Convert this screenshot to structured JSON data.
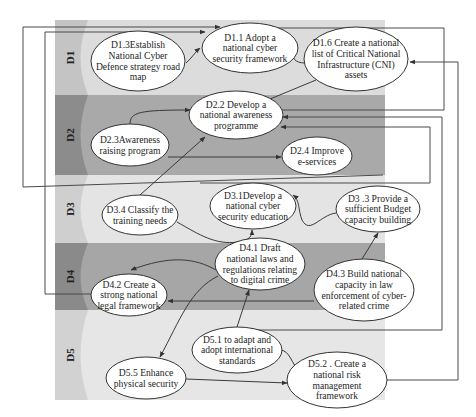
{
  "diagram": {
    "bands": [
      {
        "id": "D1",
        "label": "D1",
        "y": 20,
        "h": 75,
        "color": "#dcdcdc",
        "edge_color": "#c4c4c4"
      },
      {
        "id": "D2",
        "label": "D2",
        "y": 95,
        "h": 80,
        "color": "#a9a9a9",
        "edge_color": "#8c8c8c"
      },
      {
        "id": "D3",
        "label": "D3",
        "y": 175,
        "h": 68,
        "color": "#e4e4e4",
        "edge_color": "#cfcfcf"
      },
      {
        "id": "D4",
        "label": "D4",
        "y": 243,
        "h": 67,
        "color": "#a6a6a6",
        "edge_color": "#8a8a8a"
      },
      {
        "id": "D5",
        "label": "D5",
        "y": 310,
        "h": 90,
        "color": "#e6e6e6",
        "edge_color": "#d2d2d2"
      }
    ],
    "nodes": [
      {
        "id": "D1.3",
        "lines": [
          "D1.3Establish",
          "National Cyber",
          "Defence strategy road",
          "map"
        ],
        "cx": 138,
        "cy": 61,
        "rx": 47,
        "ry": 30
      },
      {
        "id": "D1.1",
        "lines": [
          "D1.1 Adopt a",
          "national cyber",
          "security framework"
        ],
        "cx": 250,
        "cy": 48,
        "rx": 48,
        "ry": 25
      },
      {
        "id": "D1.6",
        "lines": [
          "D1.6 Create a national",
          "list of Critical National",
          "Infrastructure (CNI)",
          "assets"
        ],
        "cx": 356,
        "cy": 59,
        "rx": 52,
        "ry": 32
      },
      {
        "id": "D2.2",
        "lines": [
          "D2.2 Develop a",
          "national awareness",
          "programme"
        ],
        "cx": 236,
        "cy": 115,
        "rx": 47,
        "ry": 24
      },
      {
        "id": "D2.3",
        "lines": [
          "D2.3Awareness",
          "raising program"
        ],
        "cx": 130,
        "cy": 145,
        "rx": 39,
        "ry": 21
      },
      {
        "id": "D2.4",
        "lines": [
          "D2.4 Improve",
          "e-services"
        ],
        "cx": 317,
        "cy": 156,
        "rx": 35,
        "ry": 19
      },
      {
        "id": "D3.1",
        "lines": [
          "D3.1Develop a",
          "national cyber",
          "security education"
        ],
        "cx": 253,
        "cy": 206,
        "rx": 43,
        "ry": 23
      },
      {
        "id": "D3.3",
        "lines": [
          "D3 .3 Provide a",
          "sufficient Budget",
          "capacity building"
        ],
        "cx": 378,
        "cy": 209,
        "rx": 42,
        "ry": 23
      },
      {
        "id": "D3.4",
        "lines": [
          "D3.4 Classify the",
          "training needs"
        ],
        "cx": 140,
        "cy": 215,
        "rx": 38,
        "ry": 20
      },
      {
        "id": "D4.1",
        "lines": [
          "D4.1 Draft",
          "national laws and",
          "regulations relating",
          "to digital crime"
        ],
        "cx": 260,
        "cy": 264,
        "rx": 45,
        "ry": 26
      },
      {
        "id": "D4.2",
        "lines": [
          "D4.2 Create a",
          "strong national",
          "legal framework"
        ],
        "cx": 129,
        "cy": 295,
        "rx": 38,
        "ry": 21
      },
      {
        "id": "D4.3",
        "lines": [
          "D4.3 Build national",
          "capacity in law",
          "enforcement of cyber-",
          "related crime"
        ],
        "cx": 364,
        "cy": 290,
        "rx": 50,
        "ry": 31
      },
      {
        "id": "D5.1",
        "lines": [
          "D5.1 to adapt and",
          "adopt international",
          "standards"
        ],
        "cx": 237,
        "cy": 350,
        "rx": 45,
        "ry": 23
      },
      {
        "id": "D5.5",
        "lines": [
          "D5.5 Enhance",
          "physical security"
        ],
        "cx": 146,
        "cy": 378,
        "rx": 40,
        "ry": 21
      },
      {
        "id": "D5.2",
        "lines": [
          "D5.2 . Create a",
          "national risk",
          "management",
          "framework"
        ],
        "cx": 337,
        "cy": 380,
        "rx": 50,
        "ry": 28
      }
    ],
    "edges": [
      {
        "from": "D1.3",
        "to": "D1.1",
        "path": "M186,63 C192,58 195,52 200,48"
      },
      {
        "from": "D1.6",
        "to": "D1.1",
        "path": "M305,63 C295,63 292,58 293,52"
      },
      {
        "from": "D1.6",
        "to": "D2.2",
        "path": "M316,80 L258,104"
      },
      {
        "from": "D2.3",
        "to": "D2.2",
        "path": "M130,124 C130,112 140,110 190,110"
      },
      {
        "from": "D2.3",
        "to": "D2.4",
        "path": "M168,157 L281,157"
      },
      {
        "from": "D3.4",
        "to": "D2.2",
        "path": "M140,195 L205,137"
      },
      {
        "from": "D3.4",
        "to": "D3.1",
        "path": "M177,222 C200,235 215,245 238,242 C250,240 252,236 252,230"
      },
      {
        "from": "D3.3",
        "to": "D3.1",
        "path": "M336,213 C320,215 310,235 302,220 C298,210 300,200 293,195"
      },
      {
        "from": "D4.3",
        "to": "D3.3",
        "path": "M362,259 L378,233"
      },
      {
        "from": "D4.1",
        "to": "D4.2",
        "path": "M216,270 C195,258 170,255 131,270"
      },
      {
        "from": "D4.1",
        "to": "D5.5",
        "path": "M218,276 C190,290 180,320 160,357"
      },
      {
        "from": "D4.3",
        "to": "D4.2",
        "path": "M314,301 L168,301"
      },
      {
        "from": "D5.1",
        "to": "D4.1",
        "path": "M237,327 L249,290"
      },
      {
        "from": "D5.1",
        "to": "D5.2",
        "path": "M280,350 C290,350 292,365 298,369"
      },
      {
        "from": "D5.5",
        "to": "D5.2",
        "path": "M186,379 L287,383"
      }
    ],
    "connectors": [
      {
        "from": "D4.2",
        "to": "D1.1",
        "path": "M91,294 L45,294 L45,32 L205,32"
      },
      {
        "from": "D2.3",
        "to": "D1.1",
        "path": "M383,175 L23,187 L23,27 L220,27"
      },
      {
        "from": "D1.6 loop",
        "to": "D1.1",
        "path": "M275,110 L444,110 L444,28 L268,28"
      },
      {
        "from": "D5.2",
        "to": "D1.6",
        "path": "M387,380 L458,380 L458,62 L410,62"
      },
      {
        "from": "D4.3 loop",
        "to": "D2.2",
        "path": "M240,330 L442,330 L442,117 L283,117"
      },
      {
        "from": "D3 loop",
        "to": "D2.2",
        "path": "M200,183 L430,183 L430,127 L281,127"
      }
    ]
  }
}
